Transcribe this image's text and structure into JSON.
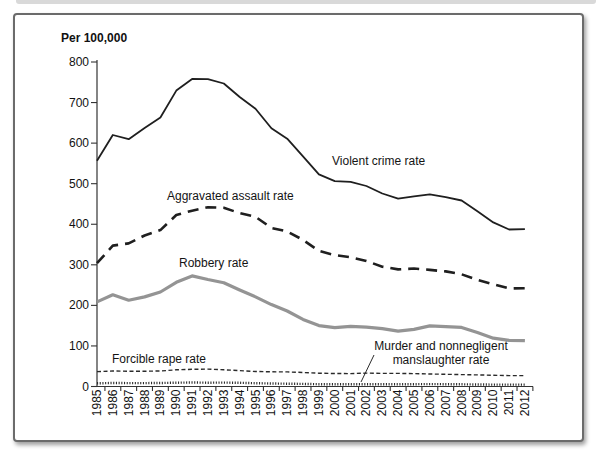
{
  "page": {
    "unit_label": "Per 100,000"
  },
  "chart_data": {
    "type": "line",
    "title": "Per 100,000",
    "xlabel": "",
    "ylabel": "Per 100,000",
    "ylim": [
      0,
      800
    ],
    "y_ticks": [
      800,
      700,
      600,
      500,
      400,
      300,
      200,
      100,
      0
    ],
    "grid": false,
    "legend_position": "inline-annotations",
    "categories": [
      "1985",
      "1986",
      "1987",
      "1988",
      "1989",
      "1990",
      "1991",
      "1992",
      "1993",
      "1994",
      "1995",
      "1996",
      "1997",
      "1998",
      "1999",
      "2000",
      "2001",
      "2002",
      "2003",
      "2004",
      "2005",
      "2006",
      "2007",
      "2008",
      "2009",
      "2010",
      "2011",
      "2012"
    ],
    "series": [
      {
        "name": "Violent crime rate",
        "style": "solid-black",
        "values": [
          556.6,
          620.1,
          609.7,
          637.2,
          663.1,
          729.6,
          758.2,
          757.7,
          747.1,
          713.6,
          684.5,
          636.6,
          611.0,
          567.6,
          523.0,
          506.5,
          504.5,
          494.4,
          475.8,
          463.2,
          469.0,
          473.6,
          466.9,
          458.6,
          431.9,
          404.5,
          387.1,
          387.8
        ]
      },
      {
        "name": "Aggravated assault rate",
        "style": "dashed-black",
        "values": [
          304.0,
          347.4,
          352.9,
          372.2,
          385.6,
          422.9,
          433.4,
          441.9,
          440.5,
          427.6,
          418.3,
          391.0,
          382.1,
          361.4,
          334.3,
          324.0,
          318.6,
          309.5,
          295.4,
          288.6,
          290.8,
          287.5,
          283.8,
          276.7,
          262.8,
          252.3,
          241.5,
          242.3
        ]
      },
      {
        "name": "Robbery rate",
        "style": "solid-gray-thick",
        "values": [
          208.5,
          226.0,
          212.7,
          220.9,
          233.0,
          257.0,
          272.7,
          263.7,
          256.0,
          237.8,
          220.9,
          201.9,
          186.2,
          165.5,
          150.1,
          145.0,
          148.5,
          146.1,
          142.5,
          136.7,
          140.8,
          149.4,
          147.6,
          145.7,
          133.1,
          119.1,
          113.7,
          112.9
        ]
      },
      {
        "name": "Forcible rape rate",
        "style": "fine-dash-black",
        "values": [
          36.8,
          38.1,
          37.6,
          37.8,
          38.3,
          41.1,
          42.3,
          42.8,
          41.1,
          39.3,
          37.1,
          36.3,
          35.9,
          34.5,
          32.8,
          32.0,
          31.8,
          33.1,
          32.3,
          32.4,
          31.8,
          30.9,
          30.0,
          29.4,
          28.7,
          27.7,
          26.8,
          26.9
        ]
      },
      {
        "name": "Murder and nonnegligent manslaughter rate",
        "style": "dotted-black",
        "values": [
          8.0,
          8.6,
          8.3,
          8.5,
          8.7,
          9.4,
          9.8,
          9.3,
          9.5,
          9.0,
          8.2,
          7.4,
          6.8,
          6.3,
          5.7,
          5.5,
          5.6,
          5.6,
          5.7,
          5.5,
          5.6,
          5.8,
          5.7,
          5.4,
          5.0,
          4.8,
          4.7,
          4.7
        ]
      }
    ],
    "annotations": {
      "violent_label": "Violent crime rate",
      "assault_label": "Aggravated assault rate",
      "robbery_label": "Robbery rate",
      "rape_label": "Forcible rape rate",
      "murder_label_line1": "Murder and nonnegligent",
      "murder_label_line2": "manslaughter rate"
    },
    "colors": {
      "line_black": "#1f1f1f",
      "line_gray": "#949494",
      "axis": "#333333",
      "card_border": "#6b6b6b",
      "top_strip": "#d9d9d9"
    }
  }
}
